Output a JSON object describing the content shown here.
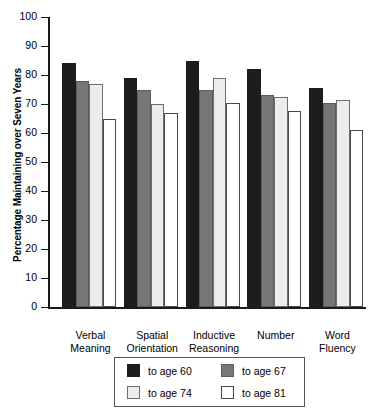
{
  "chart_data": {
    "type": "bar",
    "title": "",
    "xlabel": "",
    "ylabel": "Percentage Maintaining over Seven Years",
    "ylim": [
      0,
      100
    ],
    "yticks": [
      0,
      10,
      20,
      30,
      40,
      50,
      60,
      70,
      80,
      90,
      100
    ],
    "grid": false,
    "legend_position": "bottom",
    "categories": [
      "Verbal Meaning",
      "Spatial Orientation",
      "Inductive Reasoning",
      "Number",
      "Word Fluency"
    ],
    "category_lines": [
      [
        "Verbal",
        "Meaning"
      ],
      [
        "Spatial",
        "Orientation"
      ],
      [
        "Inductive",
        "Reasoning"
      ],
      [
        "Number",
        ""
      ],
      [
        "Word",
        "Fluency"
      ]
    ],
    "series": [
      {
        "name": "to age 60",
        "color": "#1c1c1c",
        "values": [
          84,
          79,
          85,
          82,
          75.5
        ]
      },
      {
        "name": "to age 67",
        "color": "#767676",
        "values": [
          78,
          75,
          75,
          73,
          70.5
        ]
      },
      {
        "name": "to age 74",
        "color": "#ececec",
        "values": [
          77,
          70,
          79,
          72.5,
          71.5
        ]
      },
      {
        "name": "to age 81",
        "color": "#ffffff",
        "values": [
          65,
          67,
          70.5,
          67.5,
          61
        ]
      }
    ]
  },
  "legend": {
    "items": [
      {
        "label": "to age 60"
      },
      {
        "label": "to age 67"
      },
      {
        "label": "to age 74"
      },
      {
        "label": "to age 81"
      }
    ]
  }
}
